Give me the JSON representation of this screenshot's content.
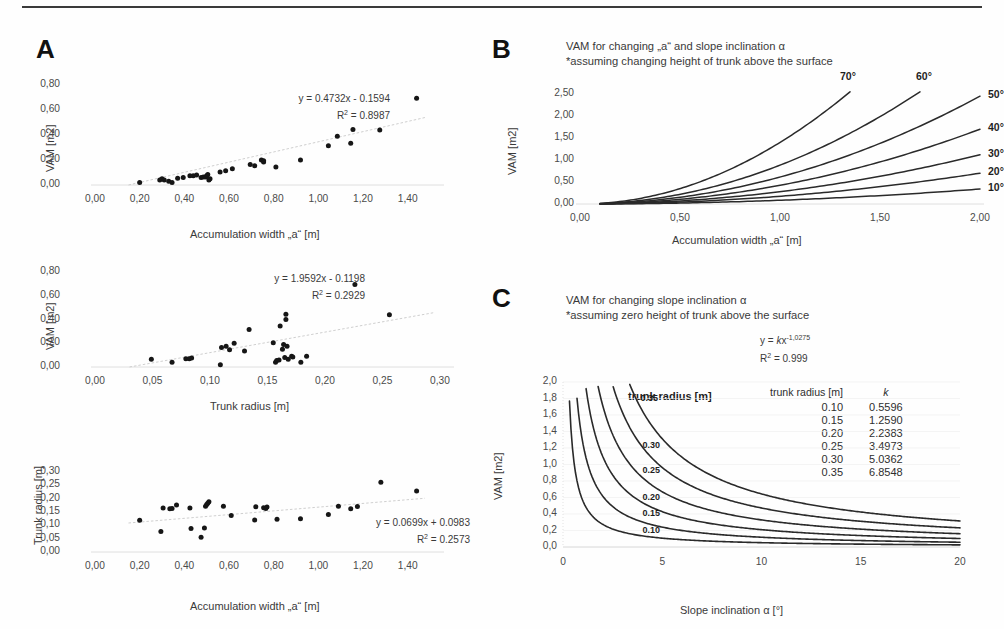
{
  "figure": {
    "panels": [
      "A",
      "B",
      "C"
    ]
  },
  "panelA": {
    "letter": "A",
    "charts": [
      {
        "id": "a1",
        "type": "scatter",
        "title": "",
        "xlabel": "Accumulation width „a“ [m]",
        "ylabel": "VAM [m2]",
        "xticks": [
          "0,00",
          "0,20",
          "0,40",
          "0,60",
          "0,80",
          "1,00",
          "1,20",
          "1,40"
        ],
        "yticks": [
          "0,00",
          "0,20",
          "0,40",
          "0,60",
          "0,80"
        ],
        "xlim": [
          0.0,
          1.5
        ],
        "ylim": [
          0.0,
          0.8
        ],
        "equation": "y = 0.4732x - 0.1594",
        "r2_label": "R",
        "r2_sup": "2",
        "r2_value": " = 0.8987",
        "trendline": {
          "slope": 0.4732,
          "intercept": -0.1594
        },
        "points": [
          [
            0.2,
            0.02
          ],
          [
            0.29,
            0.04
          ],
          [
            0.3,
            0.05
          ],
          [
            0.31,
            0.04
          ],
          [
            0.33,
            0.03
          ],
          [
            0.345,
            0.02
          ],
          [
            0.37,
            0.055
          ],
          [
            0.395,
            0.06
          ],
          [
            0.425,
            0.075
          ],
          [
            0.44,
            0.075
          ],
          [
            0.455,
            0.08
          ],
          [
            0.475,
            0.06
          ],
          [
            0.485,
            0.065
          ],
          [
            0.495,
            0.065
          ],
          [
            0.5,
            0.075
          ],
          [
            0.505,
            0.085
          ],
          [
            0.51,
            0.04
          ],
          [
            0.515,
            0.05
          ],
          [
            0.56,
            0.105
          ],
          [
            0.585,
            0.115
          ],
          [
            0.615,
            0.13
          ],
          [
            0.695,
            0.165
          ],
          [
            0.715,
            0.155
          ],
          [
            0.745,
            0.2
          ],
          [
            0.755,
            0.195
          ],
          [
            0.755,
            0.185
          ],
          [
            0.81,
            0.145
          ],
          [
            0.92,
            0.2
          ],
          [
            1.045,
            0.315
          ],
          [
            1.085,
            0.39
          ],
          [
            1.145,
            0.335
          ],
          [
            1.155,
            0.445
          ],
          [
            1.275,
            0.44
          ],
          [
            1.44,
            0.695
          ]
        ]
      },
      {
        "id": "a2",
        "type": "scatter",
        "title": "",
        "xlabel": "Trunk radius [m]",
        "ylabel": "VAM [m2]",
        "xticks": [
          "0,00",
          "0,05",
          "0,10",
          "0,15",
          "0,20",
          "0,25",
          "0,30"
        ],
        "yticks": [
          "0,00",
          "0,20",
          "0,40",
          "0,60",
          "0,80"
        ],
        "xlim": [
          0.0,
          0.3
        ],
        "ylim": [
          0.0,
          0.8
        ],
        "equation": "y = 1.9592x - 0.1198",
        "r2_label": "R",
        "r2_sup": "2",
        "r2_value": " = 0.2929",
        "trendline": {
          "slope": 1.9592,
          "intercept": -0.1198
        },
        "points": [
          [
            0.049,
            0.065
          ],
          [
            0.067,
            0.04
          ],
          [
            0.079,
            0.07
          ],
          [
            0.082,
            0.07
          ],
          [
            0.084,
            0.075
          ],
          [
            0.109,
            0.02
          ],
          [
            0.11,
            0.165
          ],
          [
            0.114,
            0.175
          ],
          [
            0.117,
            0.145
          ],
          [
            0.121,
            0.2
          ],
          [
            0.13,
            0.135
          ],
          [
            0.134,
            0.315
          ],
          [
            0.155,
            0.205
          ],
          [
            0.157,
            0.04
          ],
          [
            0.158,
            0.055
          ],
          [
            0.16,
            0.06
          ],
          [
            0.161,
            0.345
          ],
          [
            0.163,
            0.15
          ],
          [
            0.164,
            0.19
          ],
          [
            0.165,
            0.08
          ],
          [
            0.166,
            0.4
          ],
          [
            0.166,
            0.445
          ],
          [
            0.167,
            0.175
          ],
          [
            0.168,
            0.065
          ],
          [
            0.171,
            0.09
          ],
          [
            0.172,
            0.085
          ],
          [
            0.179,
            0.04
          ],
          [
            0.184,
            0.09
          ],
          [
            0.226,
            0.695
          ],
          [
            0.256,
            0.44
          ]
        ]
      },
      {
        "id": "a3",
        "type": "scatter",
        "title": "",
        "xlabel": "Accumulation width „a“ [m]",
        "ylabel": "Trunk radius [m]",
        "xticks": [
          "0,00",
          "0,20",
          "0,40",
          "0,60",
          "0,80",
          "1,00",
          "1,20",
          "1,40"
        ],
        "yticks": [
          "0,00",
          "0,05",
          "0,10",
          "0,15",
          "0,20",
          "0,25",
          "0,30"
        ],
        "xlim": [
          0.0,
          1.5
        ],
        "ylim": [
          0.0,
          0.3
        ],
        "equation": "y = 0.0699x + 0.0983",
        "r2_label": "R",
        "r2_sup": "2",
        "r2_value": " = 0.2573",
        "trendline": {
          "slope": 0.0699,
          "intercept": 0.0983
        },
        "points": [
          [
            0.2,
            0.119
          ],
          [
            0.295,
            0.077
          ],
          [
            0.305,
            0.165
          ],
          [
            0.335,
            0.162
          ],
          [
            0.345,
            0.163
          ],
          [
            0.365,
            0.176
          ],
          [
            0.425,
            0.165
          ],
          [
            0.43,
            0.088
          ],
          [
            0.475,
            0.055
          ],
          [
            0.49,
            0.09
          ],
          [
            0.495,
            0.172
          ],
          [
            0.5,
            0.178
          ],
          [
            0.505,
            0.183
          ],
          [
            0.51,
            0.188
          ],
          [
            0.575,
            0.172
          ],
          [
            0.61,
            0.137
          ],
          [
            0.715,
            0.12
          ],
          [
            0.72,
            0.17
          ],
          [
            0.755,
            0.166
          ],
          [
            0.765,
            0.163
          ],
          [
            0.77,
            0.169
          ],
          [
            0.815,
            0.123
          ],
          [
            0.92,
            0.125
          ],
          [
            1.045,
            0.141
          ],
          [
            1.09,
            0.172
          ],
          [
            1.145,
            0.162
          ],
          [
            1.175,
            0.171
          ],
          [
            1.28,
            0.262
          ],
          [
            1.44,
            0.229
          ]
        ]
      }
    ]
  },
  "panelB": {
    "letter": "B",
    "heading_line1": "VAM for changing „a“ and slope inclination α",
    "heading_line2": "*assuming changing height of trunk above the surface",
    "chart_data": {
      "type": "line",
      "title": "VAM for changing „a“ and slope inclination α",
      "xlabel": "Accumulation width „a“ [m]",
      "ylabel": "VAM [m2]",
      "xticks": [
        "0,00",
        "0,50",
        "1,00",
        "1,50",
        "2,00"
      ],
      "yticks": [
        "0,00",
        "0,50",
        "1,00",
        "1,50",
        "2,00",
        "2,50"
      ],
      "xlim": [
        0.0,
        2.0
      ],
      "ylim": [
        0.0,
        2.5
      ],
      "grid": false,
      "legend_position": "curve-end labels",
      "series": [
        {
          "name": "70°",
          "coef": 1.4,
          "x_end": 1.35,
          "y_end": 2.55
        },
        {
          "name": "60°",
          "coef": 0.9,
          "x_end": 1.7,
          "y_end": 2.55
        },
        {
          "name": "50°",
          "coef": 0.62,
          "x_end": 2.0,
          "y_end": 2.45
        },
        {
          "name": "40°",
          "coef": 0.42,
          "x_end": 2.0,
          "y_end": 1.7
        },
        {
          "name": "30°",
          "coef": 0.28,
          "x_end": 2.0,
          "y_end": 1.12
        },
        {
          "name": "20°",
          "coef": 0.175,
          "x_end": 2.0,
          "y_end": 0.7
        },
        {
          "name": "10°",
          "coef": 0.085,
          "x_end": 2.0,
          "y_end": 0.34
        }
      ]
    }
  },
  "panelC": {
    "letter": "C",
    "heading_line1": "VAM for changing slope inclination α",
    "heading_line2": "*assuming zero height of trunk above the surface",
    "equation_prefix": "y = ",
    "equation_k": "k",
    "equation_x": "x",
    "equation_exp": "-1,0275",
    "r2_label": "R",
    "r2_sup": "2",
    "r2_value": " = 0.999",
    "legend_title": "trunk radius [m]",
    "table": {
      "headers": [
        "trunk radius [m]",
        "k"
      ],
      "rows": [
        [
          "0.10",
          "0.5596"
        ],
        [
          "0.15",
          "1.2590"
        ],
        [
          "0.20",
          "2.2383"
        ],
        [
          "0.25",
          "3.4973"
        ],
        [
          "0.30",
          "5.0362"
        ],
        [
          "0.35",
          "6.8548"
        ]
      ]
    },
    "chart_data": {
      "type": "line",
      "title": "VAM for changing slope inclination α",
      "xlabel": "Slope inclination α [°]",
      "ylabel": "VAM [m2]",
      "xticks": [
        "0",
        "5",
        "10",
        "15",
        "20"
      ],
      "yticks": [
        "0,0",
        "0,2",
        "0,4",
        "0,6",
        "0,8",
        "1,0",
        "1,2",
        "1,4",
        "1,6",
        "1,8",
        "2,0"
      ],
      "xlim": [
        0,
        20
      ],
      "ylim": [
        0.0,
        2.0
      ],
      "exponent": -1.0275,
      "grid": true,
      "series": [
        {
          "name": "0.35",
          "k": 6.8548
        },
        {
          "name": "0.30",
          "k": 5.0362
        },
        {
          "name": "0.25",
          "k": 3.4973
        },
        {
          "name": "0.20",
          "k": 2.2383
        },
        {
          "name": "0.15",
          "k": 1.259
        },
        {
          "name": "0.10",
          "k": 0.5596
        }
      ],
      "inline_labels": [
        {
          "text": "0.35",
          "x": 3.9,
          "y": 1.8
        },
        {
          "text": "0.30",
          "x": 4.0,
          "y": 1.22
        },
        {
          "text": "0.25",
          "x": 4.0,
          "y": 0.92
        },
        {
          "text": "0.20",
          "x": 4.0,
          "y": 0.6
        },
        {
          "text": "0.15",
          "x": 4.0,
          "y": 0.4
        },
        {
          "text": "0.10",
          "x": 4.0,
          "y": 0.2
        }
      ]
    }
  }
}
